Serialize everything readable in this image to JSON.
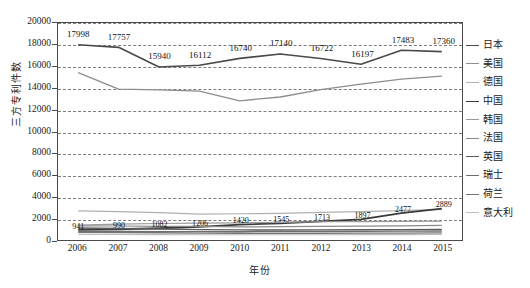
{
  "chart_data": {
    "type": "line",
    "title": "",
    "xlabel": "年份",
    "ylabel": "三方专利件数",
    "grid": true,
    "legend_position": "right",
    "categories": [
      "2006",
      "2007",
      "2008",
      "2009",
      "2010",
      "2011",
      "2012",
      "2013",
      "2014",
      "2015"
    ],
    "x": [
      2006,
      2007,
      2008,
      2009,
      2010,
      2011,
      2012,
      2013,
      2014,
      2015
    ],
    "ylim": [
      0,
      20000
    ],
    "ytick_labels": [
      "20000",
      "18000",
      "16000",
      "14000",
      "12000",
      "10000",
      "8000",
      "6000",
      "4000",
      "2000",
      "0"
    ],
    "ytick_values": [
      20000,
      18000,
      16000,
      14000,
      12000,
      10000,
      8000,
      6000,
      4000,
      2000,
      0
    ],
    "series": [
      {
        "name": "日本",
        "color": "#4a4a4a",
        "width": 1.6,
        "values": [
          17998,
          17757,
          15940,
          16112,
          16740,
          17140,
          16722,
          16197,
          17483,
          17360
        ],
        "labels": [
          "17998",
          "17757",
          "15940",
          "16112",
          "16740",
          "17140",
          "16722",
          "16197",
          "17483",
          "17360"
        ]
      },
      {
        "name": "美国",
        "color": "#8d8d8d",
        "width": 1.3,
        "values": [
          15420,
          13900,
          13840,
          13720,
          12830,
          13180,
          13860,
          14360,
          14820,
          15100
        ],
        "labels": []
      },
      {
        "name": "德国",
        "color": "#b0b0b0",
        "width": 1.2,
        "values": [
          2680,
          2620,
          2520,
          2380,
          2420,
          2460,
          2540,
          2620,
          2700,
          2830
        ],
        "labels": []
      },
      {
        "name": "中国",
        "color": "#3a3a3a",
        "width": 1.8,
        "values": [
          941,
          990,
          1082,
          1206,
          1420,
          1545,
          1713,
          1897,
          2477,
          2889
        ],
        "labels": [
          "941",
          "990",
          "1082",
          "1206",
          "1420",
          "1545",
          "1713",
          "1897",
          "2477",
          "2889"
        ]
      },
      {
        "name": "韩国",
        "color": "#9a9a9a",
        "width": 1.2,
        "values": [
          1380,
          1470,
          1520,
          1560,
          1580,
          1620,
          1680,
          1700,
          1720,
          1740
        ],
        "labels": []
      },
      {
        "name": "法国",
        "color": "#8a8a8a",
        "width": 1.2,
        "values": [
          1300,
          1290,
          1260,
          1250,
          1210,
          1230,
          1250,
          1270,
          1300,
          1340
        ],
        "labels": []
      },
      {
        "name": "英国",
        "color": "#5c5c5c",
        "width": 1.4,
        "values": [
          1100,
          1060,
          1010,
          960,
          930,
          920,
          930,
          940,
          960,
          980
        ],
        "labels": []
      },
      {
        "name": "瑞士",
        "color": "#6e6e6e",
        "width": 1.3,
        "values": [
          800,
          790,
          780,
          770,
          760,
          780,
          790,
          800,
          810,
          830
        ],
        "labels": []
      },
      {
        "name": "荷兰",
        "color": "#757575",
        "width": 1.3,
        "values": [
          700,
          690,
          670,
          640,
          620,
          615,
          620,
          630,
          640,
          650
        ],
        "labels": []
      },
      {
        "name": "意大利",
        "color": "#bdbdbd",
        "width": 1.1,
        "values": [
          520,
          510,
          500,
          490,
          480,
          485,
          490,
          495,
          500,
          510
        ],
        "labels": []
      }
    ]
  },
  "legend": {
    "items": [
      {
        "label": "日本"
      },
      {
        "label": "美国"
      },
      {
        "label": "德国"
      },
      {
        "label": "中国"
      },
      {
        "label": "韩国"
      },
      {
        "label": "法国"
      },
      {
        "label": "英国"
      },
      {
        "label": "瑞士"
      },
      {
        "label": "荷兰"
      },
      {
        "label": "意大利"
      }
    ]
  }
}
